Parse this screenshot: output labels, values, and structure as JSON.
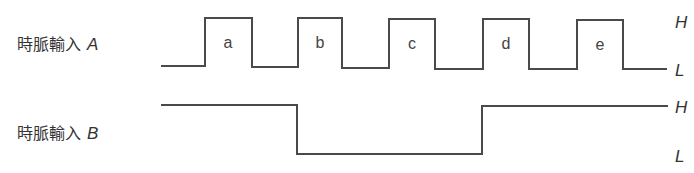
{
  "signals": [
    {
      "name": "clock-a",
      "label_text": "時脈輸入",
      "label_symbol": "A",
      "pulses": [
        "a",
        "b",
        "c",
        "d",
        "e"
      ],
      "level_high": "H",
      "level_low": "L"
    },
    {
      "name": "clock-b",
      "label_text": "時脈輸入",
      "label_symbol": "B",
      "level_high": "H",
      "level_low": "L"
    }
  ],
  "colors": {
    "line": "#4a4a4a",
    "text": "#333333"
  }
}
